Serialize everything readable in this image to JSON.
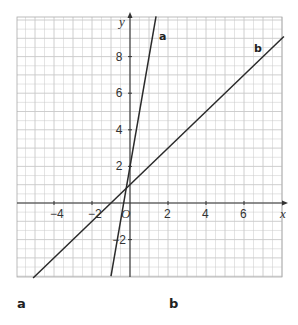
{
  "header": {
    "partial_text": "...graph..."
  },
  "chart_data": {
    "type": "line",
    "title": "",
    "xlabel": "x",
    "ylabel": "y",
    "xlim": [
      -5.8,
      8.1
    ],
    "ylim": [
      -4.1,
      10.2
    ],
    "grid": true,
    "grid_minor_step": 0.5,
    "x_ticks": [
      -4,
      -2,
      0,
      2,
      4,
      6
    ],
    "y_ticks": [
      -2,
      2,
      4,
      6,
      8
    ],
    "tick_labels": {
      "x": [
        "−4",
        "−2",
        "O",
        "2",
        "4",
        "6"
      ],
      "y": [
        "−2",
        "2",
        "4",
        "6",
        "8"
      ]
    },
    "series": [
      {
        "name": "a",
        "equation": "y = 6x + 2",
        "slope": 6,
        "intercept": 2,
        "x": [
          -1.0,
          1.37
        ],
        "y": [
          -4.0,
          10.2
        ]
      },
      {
        "name": "b",
        "equation": "y = x + 1",
        "slope": 1,
        "intercept": 1,
        "x": [
          -5.1,
          8.1
        ],
        "y": [
          -4.1,
          9.1
        ]
      }
    ],
    "legend": "inline labels near line ends"
  },
  "labels": {
    "part_a": "a",
    "part_b": "b"
  },
  "colors": {
    "grid": "#c8c8c8",
    "axis": "#333333",
    "line": "#2a2a2a"
  }
}
